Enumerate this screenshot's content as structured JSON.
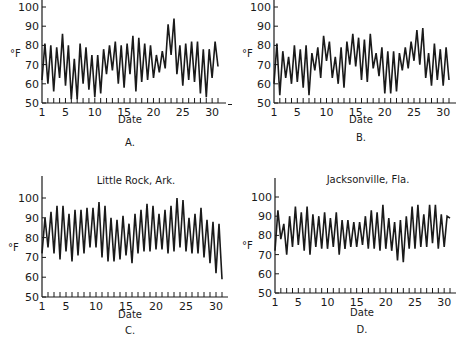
{
  "chart_data": [
    {
      "id": "A",
      "type": "line",
      "title": "",
      "panel_label": "A.",
      "xlabel": "Date",
      "ylabel": "°F",
      "ylim": [
        50,
        100
      ],
      "yticks": [
        50,
        60,
        70,
        80,
        90,
        100
      ],
      "xlim": [
        1,
        31
      ],
      "xticks": [
        1,
        5,
        10,
        15,
        20,
        25,
        30
      ],
      "grid": false,
      "x": [
        1,
        1.5,
        2,
        2.5,
        3,
        3.5,
        4,
        4.5,
        5,
        5.5,
        6,
        6.5,
        7,
        7.5,
        8,
        8.5,
        9,
        9.5,
        10,
        10.5,
        11,
        11.5,
        12,
        12.5,
        13,
        13.5,
        14,
        14.5,
        15,
        15.5,
        16,
        16.5,
        17,
        17.5,
        18,
        18.5,
        19,
        19.5,
        20,
        20.5,
        21,
        21.5,
        22,
        22.5,
        23,
        23.5,
        24,
        24.5,
        25,
        25.5,
        26,
        26.5,
        27,
        27.5,
        28,
        28.5,
        29,
        29.5,
        30,
        30.5,
        31
      ],
      "values": [
        62,
        81,
        60,
        80,
        56,
        79,
        63,
        86,
        59,
        80,
        52,
        73,
        52,
        81,
        60,
        79,
        57,
        75,
        53,
        75,
        55,
        78,
        65,
        80,
        67,
        82,
        60,
        80,
        58,
        81,
        65,
        85,
        56,
        84,
        61,
        81,
        62,
        80,
        63,
        75,
        66,
        77,
        68,
        91,
        75,
        94,
        65,
        80,
        59,
        81,
        62,
        82,
        61,
        82,
        55,
        78,
        53,
        78,
        63,
        82,
        69
      ]
    },
    {
      "id": "B",
      "type": "line",
      "title": "",
      "panel_label": "B.",
      "xlabel": "Date",
      "ylabel": "°F",
      "ylim": [
        50,
        100
      ],
      "yticks": [
        50,
        60,
        70,
        80,
        90,
        100
      ],
      "xlim": [
        1,
        31
      ],
      "xticks": [
        1,
        5,
        10,
        15,
        20,
        25,
        30
      ],
      "grid": false,
      "x": [
        1,
        1.5,
        2,
        2.5,
        3,
        3.5,
        4,
        4.5,
        5,
        5.5,
        6,
        6.5,
        7,
        7.5,
        8,
        8.5,
        9,
        9.5,
        10,
        10.5,
        11,
        11.5,
        12,
        12.5,
        13,
        13.5,
        14,
        14.5,
        15,
        15.5,
        16,
        16.5,
        17,
        17.5,
        18,
        18.5,
        19,
        19.5,
        20,
        20.5,
        21,
        21.5,
        22,
        22.5,
        23,
        23.5,
        24,
        24.5,
        25,
        25.5,
        26,
        26.5,
        27,
        27.5,
        28,
        28.5,
        29,
        29.5,
        30,
        30.5,
        31
      ],
      "values": [
        60,
        81,
        54,
        77,
        63,
        74,
        60,
        80,
        61,
        78,
        58,
        80,
        54,
        76,
        67,
        79,
        63,
        85,
        72,
        82,
        63,
        74,
        60,
        79,
        58,
        82,
        70,
        86,
        69,
        84,
        62,
        83,
        61,
        86,
        68,
        76,
        64,
        79,
        55,
        77,
        55,
        77,
        56,
        76,
        67,
        79,
        68,
        82,
        72,
        88,
        70,
        89,
        63,
        76,
        59,
        81,
        62,
        78,
        59,
        79,
        62
      ]
    },
    {
      "id": "C",
      "type": "line",
      "title": "Little Rock, Ark.",
      "panel_label": "C.",
      "xlabel": "Date",
      "ylabel": "°F",
      "ylim": [
        50,
        100
      ],
      "yticks": [
        50,
        60,
        70,
        80,
        90,
        100
      ],
      "xlim": [
        1,
        31
      ],
      "xticks": [
        1,
        5,
        10,
        15,
        20,
        25,
        30
      ],
      "grid": false,
      "x": [
        1,
        1.5,
        2,
        2.5,
        3,
        3.5,
        4,
        4.5,
        5,
        5.5,
        6,
        6.5,
        7,
        7.5,
        8,
        8.5,
        9,
        9.5,
        10,
        10.5,
        11,
        11.5,
        12,
        12.5,
        13,
        13.5,
        14,
        14.5,
        15,
        15.5,
        16,
        16.5,
        17,
        17.5,
        18,
        18.5,
        19,
        19.5,
        20,
        20.5,
        21,
        21.5,
        22,
        22.5,
        23,
        23.5,
        24,
        24.5,
        25,
        25.5,
        26,
        26.5,
        27,
        27.5,
        28,
        28.5,
        29,
        29.5,
        30,
        30.5,
        31
      ],
      "values": [
        72,
        90,
        75,
        93,
        72,
        96,
        69,
        96,
        73,
        92,
        68,
        94,
        71,
        94,
        72,
        95,
        75,
        95,
        75,
        98,
        70,
        96,
        68,
        90,
        68,
        89,
        69,
        91,
        71,
        87,
        67,
        92,
        72,
        94,
        73,
        97,
        73,
        96,
        74,
        92,
        74,
        94,
        72,
        96,
        73,
        100,
        75,
        99,
        73,
        90,
        72,
        92,
        72,
        95,
        70,
        89,
        67,
        88,
        62,
        87,
        59
      ]
    },
    {
      "id": "D",
      "type": "line",
      "title": "Jacksonville, Fla.",
      "panel_label": "D.",
      "xlabel": "Date",
      "ylabel": "°F",
      "ylim": [
        50,
        100
      ],
      "yticks": [
        50,
        60,
        70,
        80,
        90,
        100
      ],
      "xlim": [
        1,
        31
      ],
      "xticks": [
        1,
        5,
        10,
        15,
        20,
        25,
        30
      ],
      "grid": false,
      "x": [
        1,
        1.5,
        2,
        2.5,
        3,
        3.5,
        4,
        4.5,
        5,
        5.5,
        6,
        6.5,
        7,
        7.5,
        8,
        8.5,
        9,
        9.5,
        10,
        10.5,
        11,
        11.5,
        12,
        12.5,
        13,
        13.5,
        14,
        14.5,
        15,
        15.5,
        16,
        16.5,
        17,
        17.5,
        18,
        18.5,
        19,
        19.5,
        20,
        20.5,
        21,
        21.5,
        22,
        22.5,
        23,
        23.5,
        24,
        24.5,
        25,
        25.5,
        26,
        26.5,
        27,
        27.5,
        28,
        28.5,
        29,
        29.5,
        30,
        30.5,
        31
      ],
      "values": [
        72,
        93,
        78,
        86,
        70,
        90,
        74,
        95,
        75,
        92,
        72,
        95,
        70,
        91,
        74,
        90,
        73,
        92,
        73,
        89,
        74,
        92,
        70,
        88,
        73,
        88,
        74,
        87,
        74,
        87,
        75,
        90,
        73,
        93,
        73,
        92,
        72,
        96,
        73,
        89,
        72,
        87,
        67,
        88,
        66,
        90,
        73,
        95,
        73,
        96,
        74,
        91,
        74,
        96,
        76,
        96,
        73,
        91,
        74,
        90,
        89
      ]
    }
  ],
  "panels": {
    "A": {
      "title": "",
      "label": "A.",
      "xlabel": "Date",
      "ylabel": "°F"
    },
    "B": {
      "title": "",
      "label": "B.",
      "xlabel": "Date",
      "ylabel": "°F"
    },
    "C": {
      "title": "Little Rock, Ark.",
      "label": "C.",
      "xlabel": "Date",
      "ylabel": "°F"
    },
    "D": {
      "title": "Jacksonville, Fla.",
      "label": "D.",
      "xlabel": "Date",
      "ylabel": "°F"
    }
  }
}
